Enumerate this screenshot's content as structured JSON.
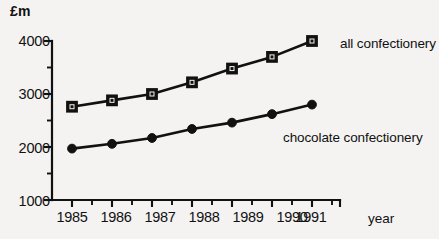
{
  "chart_data": {
    "type": "line",
    "title": "",
    "ylabel": "£m",
    "xlabel": "year",
    "categories": [
      "1985",
      "1986",
      "1987",
      "1988",
      "1989",
      "1990",
      "1991"
    ],
    "x": [
      1985,
      1986,
      1987,
      1988,
      1989,
      1990,
      1991
    ],
    "ylim": [
      1000,
      4000
    ],
    "yticks": [
      1000,
      2000,
      3000,
      4000
    ],
    "ytick_labels": [
      "1000",
      "2000",
      "3000",
      "4000"
    ],
    "yminor_ticks": [
      1500,
      2500,
      3500
    ],
    "grid": false,
    "legend_position": "inline-right",
    "series": [
      {
        "name": "all confectionery",
        "marker": "square",
        "values": [
          2760,
          2880,
          3000,
          3220,
          3480,
          3700,
          4000
        ]
      },
      {
        "name": "chocolate confectionery",
        "marker": "circle",
        "values": [
          1970,
          2060,
          2170,
          2340,
          2460,
          2620,
          2800
        ]
      }
    ]
  },
  "axes": {
    "y_title": "£m",
    "x_title": "year",
    "y_labels": [
      "4000",
      "3000",
      "2000",
      "1000"
    ],
    "x_labels": [
      "1985",
      "1986",
      "1987",
      "1988",
      "1989",
      "1990",
      "1991"
    ]
  },
  "annotations": {
    "series_all_label": "all confectionery",
    "series_chocolate_label": "chocolate confectionery"
  },
  "colors": {
    "background": "#f4f3f1",
    "ink": "#111111",
    "marker_fill": "#f4f3f1"
  }
}
